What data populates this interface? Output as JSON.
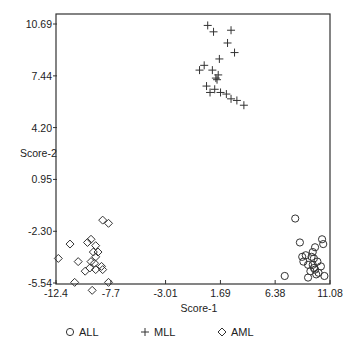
{
  "chart_data": {
    "type": "scatter",
    "title": "",
    "xlabel": "Score-1",
    "ylabel": "Score-2",
    "xlim": [
      -12.4,
      11.08
    ],
    "ylim": [
      -5.54,
      10.69
    ],
    "xticks": [
      -12.4,
      -7.7,
      -3.01,
      1.69,
      6.38,
      11.08
    ],
    "xtick_labels": [
      "-12.4",
      "-7.7",
      "-3.01",
      "1.69",
      "6.38",
      "11.08"
    ],
    "yticks": [
      10.69,
      7.44,
      4.2,
      0.95,
      -2.3,
      -5.54
    ],
    "ytick_labels": [
      "10.69",
      "7.44",
      "4.20",
      "0.95",
      "-2.30",
      "-5.54"
    ],
    "grid": false,
    "legend_position": "bottom",
    "series": [
      {
        "name": "ALL",
        "marker": "circle",
        "points": [
          [
            8.1,
            -1.5
          ],
          [
            8.5,
            -3.0
          ],
          [
            10.4,
            -2.8
          ],
          [
            10.5,
            -3.1
          ],
          [
            9.6,
            -3.6
          ],
          [
            9.0,
            -3.8
          ],
          [
            9.5,
            -3.9
          ],
          [
            9.7,
            -4.0
          ],
          [
            8.8,
            -4.2
          ],
          [
            9.2,
            -4.4
          ],
          [
            9.6,
            -4.4
          ],
          [
            9.7,
            -4.6
          ],
          [
            9.8,
            -4.7
          ],
          [
            10.0,
            -4.2
          ],
          [
            10.3,
            -4.5
          ],
          [
            10.1,
            -4.9
          ],
          [
            9.4,
            -4.8
          ],
          [
            8.7,
            -3.9
          ],
          [
            9.9,
            -5.0
          ],
          [
            10.6,
            -5.1
          ],
          [
            9.2,
            -5.2
          ],
          [
            7.2,
            -5.1
          ],
          [
            9.8,
            -3.3
          ]
        ]
      },
      {
        "name": "MLL",
        "marker": "plus",
        "points": [
          [
            0.6,
            10.6
          ],
          [
            1.1,
            10.2
          ],
          [
            2.6,
            10.3
          ],
          [
            2.3,
            9.5
          ],
          [
            2.9,
            8.9
          ],
          [
            1.6,
            8.5
          ],
          [
            0.3,
            8.1
          ],
          [
            -0.1,
            7.8
          ],
          [
            1.0,
            7.8
          ],
          [
            1.3,
            7.3
          ],
          [
            1.4,
            7.2
          ],
          [
            0.5,
            6.8
          ],
          [
            0.8,
            6.4
          ],
          [
            1.7,
            6.4
          ],
          [
            2.2,
            6.3
          ],
          [
            2.6,
            6.0
          ],
          [
            3.1,
            5.9
          ],
          [
            3.7,
            5.6
          ],
          [
            1.5,
            7.5
          ],
          [
            1.2,
            6.6
          ]
        ]
      },
      {
        "name": "AML",
        "marker": "diamond",
        "points": [
          [
            -8.4,
            -1.6
          ],
          [
            -7.9,
            -1.8
          ],
          [
            -11.2,
            -3.1
          ],
          [
            -9.4,
            -2.8
          ],
          [
            -9.0,
            -3.2
          ],
          [
            -9.7,
            -3.0
          ],
          [
            -9.2,
            -3.6
          ],
          [
            -8.8,
            -3.6
          ],
          [
            -12.2,
            -4.0
          ],
          [
            -10.5,
            -4.2
          ],
          [
            -9.4,
            -4.2
          ],
          [
            -9.5,
            -4.6
          ],
          [
            -9.0,
            -4.7
          ],
          [
            -8.4,
            -4.7
          ],
          [
            -8.5,
            -4.5
          ],
          [
            -9.9,
            -4.8
          ],
          [
            -10.8,
            -5.5
          ],
          [
            -7.9,
            -5.5
          ],
          [
            -9.3,
            -6.0
          ],
          [
            -9.0,
            -3.9
          ],
          [
            -9.1,
            -4.3
          ]
        ]
      }
    ]
  }
}
